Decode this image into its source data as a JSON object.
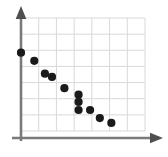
{
  "chart_data": {
    "type": "scatter",
    "title": "",
    "subtitle": "",
    "xlabel": "",
    "ylabel": "",
    "xlim": [
      0,
      7
    ],
    "ylim": [
      0,
      7
    ],
    "grid": true,
    "grid_columns": 7,
    "grid_rows": 7,
    "legend": null,
    "legend_position": "none",
    "xticks": [],
    "yticks": [],
    "annotations": [],
    "series": [
      {
        "name": "series-1",
        "marker": "circle",
        "color": "#1a1a1a",
        "points": [
          {
            "x": 0.0,
            "y": 4.85
          },
          {
            "x": 0.75,
            "y": 4.35
          },
          {
            "x": 1.35,
            "y": 3.55
          },
          {
            "x": 1.75,
            "y": 3.35
          },
          {
            "x": 2.45,
            "y": 2.65
          },
          {
            "x": 3.25,
            "y": 2.25
          },
          {
            "x": 3.25,
            "y": 1.8
          },
          {
            "x": 3.25,
            "y": 1.3
          },
          {
            "x": 3.9,
            "y": 1.3
          },
          {
            "x": 4.45,
            "y": 0.8
          },
          {
            "x": 5.1,
            "y": 0.5
          }
        ]
      }
    ]
  },
  "axes": {
    "x_axis_name": "x-axis",
    "y_axis_name": "y-axis",
    "axis_color": "#7a7a7a",
    "grid_color": "#d9d9d9",
    "arrow_color": "#555555"
  }
}
